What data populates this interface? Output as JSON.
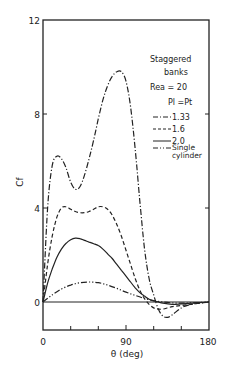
{
  "chart_data": {
    "type": "line",
    "title": "",
    "xlabel": "θ (deg)",
    "ylabel": "Cf",
    "xlim": [
      0,
      180
    ],
    "ylim": [
      -1.2,
      12
    ],
    "xticks": [
      0,
      90,
      180
    ],
    "yticks": [
      0,
      4,
      8,
      12
    ],
    "x_minor_ticks": [
      30,
      60,
      120,
      150
    ],
    "grid": false,
    "legend": {
      "position": "upper right, inside",
      "header_lines": [
        "Staggered",
        "banks",
        "Rea = 20",
        "Pl = Pt"
      ],
      "entries": [
        "1.33",
        "1.6",
        "2.0",
        "Single cylinder"
      ]
    },
    "series": [
      {
        "name": "1.33",
        "style": "dash-dot",
        "x": [
          0,
          5,
          10,
          15,
          20,
          25,
          30,
          35,
          40,
          45,
          50,
          55,
          60,
          65,
          70,
          75,
          80,
          85,
          90,
          95,
          100,
          105,
          110,
          115,
          120,
          125,
          130,
          135,
          140,
          150,
          160,
          170,
          180
        ],
        "y": [
          0,
          4.0,
          5.8,
          6.2,
          6.1,
          5.7,
          5.1,
          4.8,
          4.9,
          5.4,
          6.1,
          6.9,
          7.8,
          8.6,
          9.2,
          9.6,
          9.8,
          9.8,
          9.4,
          8.3,
          6.5,
          4.3,
          2.3,
          1.0,
          0.3,
          -0.3,
          -0.6,
          -0.65,
          -0.55,
          -0.25,
          -0.1,
          -0.05,
          0
        ]
      },
      {
        "name": "1.6",
        "style": "dashed",
        "x": [
          0,
          5,
          10,
          15,
          20,
          25,
          30,
          35,
          40,
          45,
          50,
          55,
          60,
          65,
          70,
          75,
          80,
          85,
          90,
          95,
          100,
          105,
          110,
          115,
          120,
          125,
          130,
          140,
          150,
          160,
          170,
          180
        ],
        "y": [
          0,
          1.6,
          2.8,
          3.6,
          4.0,
          4.05,
          3.95,
          3.85,
          3.8,
          3.8,
          3.85,
          3.95,
          4.05,
          4.05,
          3.95,
          3.7,
          3.3,
          2.8,
          2.2,
          1.6,
          1.0,
          0.5,
          0.15,
          -0.1,
          -0.25,
          -0.3,
          -0.3,
          -0.2,
          -0.15,
          -0.1,
          -0.05,
          0
        ]
      },
      {
        "name": "2.0",
        "style": "solid",
        "x": [
          0,
          5,
          10,
          15,
          20,
          25,
          30,
          35,
          40,
          45,
          50,
          55,
          60,
          65,
          70,
          75,
          80,
          85,
          90,
          95,
          100,
          105,
          110,
          115,
          120,
          125,
          130,
          140,
          150,
          160,
          170,
          180
        ],
        "y": [
          0,
          0.8,
          1.4,
          1.9,
          2.25,
          2.5,
          2.65,
          2.72,
          2.7,
          2.62,
          2.55,
          2.48,
          2.4,
          2.25,
          2.05,
          1.85,
          1.6,
          1.35,
          1.1,
          0.85,
          0.6,
          0.4,
          0.25,
          0.12,
          0.05,
          0.0,
          -0.05,
          -0.1,
          -0.08,
          -0.05,
          -0.03,
          0
        ]
      },
      {
        "name": "Single cylinder",
        "style": "dash-dot-dot",
        "x": [
          0,
          10,
          20,
          30,
          40,
          50,
          60,
          70,
          80,
          90,
          100,
          110,
          120,
          130,
          140,
          150,
          160,
          170,
          180
        ],
        "y": [
          0,
          0.3,
          0.55,
          0.72,
          0.82,
          0.85,
          0.82,
          0.72,
          0.58,
          0.42,
          0.28,
          0.15,
          0.06,
          0.0,
          -0.04,
          -0.05,
          -0.04,
          -0.02,
          0
        ]
      }
    ]
  },
  "labels": {
    "ylabel": "Cf",
    "xlabel": "θ (deg)",
    "yticks": [
      "12",
      "8",
      "4",
      "0"
    ],
    "xticks": [
      "0",
      "90",
      "180"
    ],
    "legend_title1": "Staggered",
    "legend_title2": "banks",
    "legend_re": "Rea = 20",
    "legend_p": "Pl =Pt",
    "legend_1": "1.33",
    "legend_2": "1.6",
    "legend_3": "2.0",
    "legend_4a": "Single",
    "legend_4b": "cylinder"
  }
}
